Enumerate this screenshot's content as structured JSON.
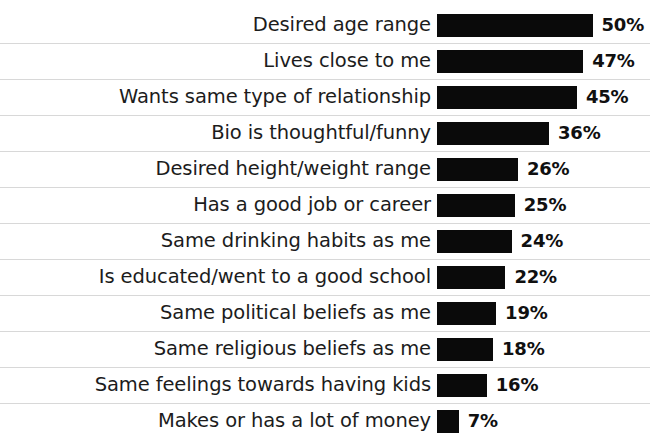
{
  "chart_data": {
    "type": "bar",
    "orientation": "horizontal",
    "title": "",
    "subtitle": "",
    "xlabel": "",
    "ylabel": "",
    "xlim": [
      0,
      50
    ],
    "grid": false,
    "legend": null,
    "value_suffix": "%",
    "value_labels_shown": true,
    "bar_color": "#0a0a0a",
    "label_color": "#1c1c1c",
    "separator_color": "#d8d8d8",
    "background_color": "#ffffff",
    "categories": [
      "Desired age range",
      "Lives close to me",
      "Wants same type of relationship",
      "Bio is thoughtful/funny",
      "Desired height/weight range",
      "Has a good job or career",
      "Same drinking habits as me",
      "Is educated/went to a good school",
      "Same political beliefs as me",
      "Same religious beliefs as me",
      "Same feelings towards having kids",
      "Makes or has a lot of money"
    ],
    "values": [
      50,
      47,
      45,
      36,
      26,
      25,
      24,
      22,
      19,
      18,
      16,
      7
    ],
    "value_labels": [
      "50%",
      "47%",
      "45%",
      "36%",
      "26%",
      "25%",
      "24%",
      "22%",
      "19%",
      "18%",
      "16%",
      "7%"
    ],
    "rows": [
      {
        "label": "Desired age range",
        "value": 50,
        "value_label": "50%"
      },
      {
        "label": "Lives close to me",
        "value": 47,
        "value_label": "47%"
      },
      {
        "label": "Wants same type of relationship",
        "value": 45,
        "value_label": "45%"
      },
      {
        "label": "Bio is thoughtful/funny",
        "value": 36,
        "value_label": "36%"
      },
      {
        "label": "Desired height/weight range",
        "value": 26,
        "value_label": "26%"
      },
      {
        "label": "Has a good job or career",
        "value": 25,
        "value_label": "25%"
      },
      {
        "label": "Same drinking habits as me",
        "value": 24,
        "value_label": "24%"
      },
      {
        "label": "Is educated/went to a good school",
        "value": 22,
        "value_label": "22%"
      },
      {
        "label": "Same political beliefs as me",
        "value": 19,
        "value_label": "19%"
      },
      {
        "label": "Same religious beliefs as me",
        "value": 18,
        "value_label": "18%"
      },
      {
        "label": "Same feelings towards having kids",
        "value": 16,
        "value_label": "16%"
      },
      {
        "label": "Makes or has a lot of money",
        "value": 7,
        "value_label": "7%"
      }
    ]
  }
}
